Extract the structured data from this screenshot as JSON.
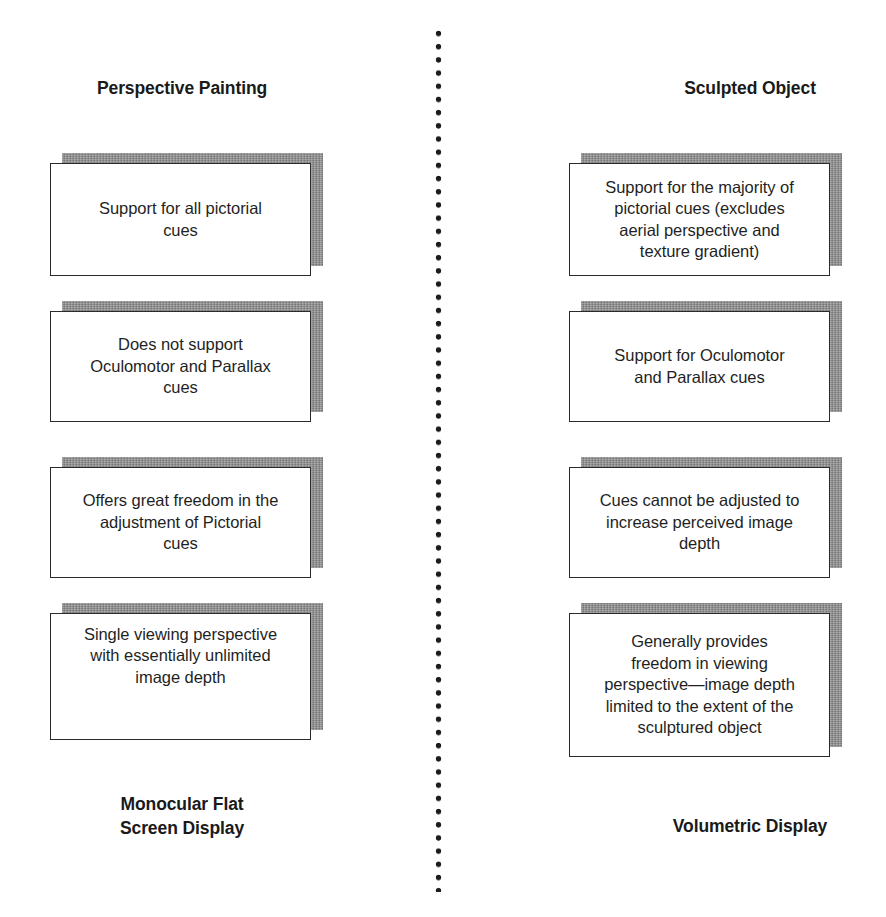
{
  "divider": {
    "style": "vertical-dotted-line"
  },
  "columns": [
    {
      "id": "perspective-painting",
      "title": "Perspective Painting",
      "footer": "Monocular Flat\nScreen Display",
      "cards": [
        {
          "text": "Support for all pictorial\ncues"
        },
        {
          "text": "Does not support\nOculomotor and Parallax\ncues"
        },
        {
          "text": "Offers great freedom in the\nadjustment of Pictorial\ncues"
        },
        {
          "text": "Single viewing perspective\nwith essentially unlimited\nimage depth"
        }
      ]
    },
    {
      "id": "sculpted-object",
      "title": "Sculpted Object",
      "footer": "Volumetric Display",
      "cards": [
        {
          "text": "Support for the majority of\npictorial cues (excludes\naerial perspective and\ntexture gradient)"
        },
        {
          "text": "Support for Oculomotor\nand Parallax cues"
        },
        {
          "text": "Cues cannot be adjusted to\nincrease perceived image\ndepth"
        },
        {
          "text": "Generally provides\nfreedom in viewing\nperspective—image depth\nlimited to the extent of the\nsculptured object"
        }
      ]
    }
  ],
  "colors": {
    "card_face": "#ffffff",
    "card_outline": "#2b2b2b",
    "card_shadow": "#8d8d8d",
    "text": "#1f1f1f",
    "divider_dot": "#1c1c1c"
  }
}
